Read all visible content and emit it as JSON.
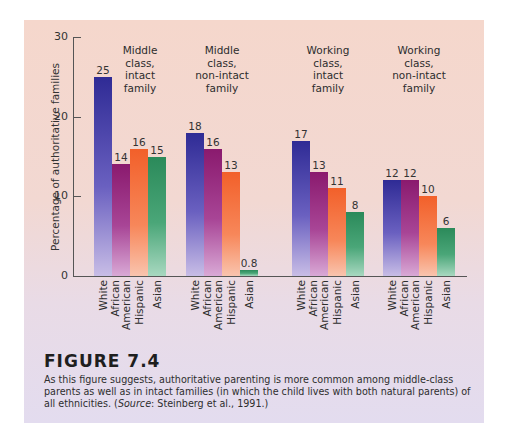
{
  "figure": {
    "title": "FIGURE 7.4",
    "caption_part1": "As this figure suggests, authoritative parenting is more common among middle-class parents as well as in intact families (in which the child lives with both natural parents) of all ethnicities. (",
    "caption_source_label": "Source",
    "caption_part2": ": Steinberg et al., 1991.)"
  },
  "colors": {
    "White": "#2f2b95",
    "African American": "#8a1a6e",
    "Hispanic": "#f2602a",
    "Asian": "#2b8a5a",
    "panel_top": "#f5d7cc",
    "panel_bottom": "#e3dcef"
  },
  "chart_data": {
    "type": "bar",
    "title": "",
    "xlabel": "",
    "ylabel": "Percentage of authoritative families",
    "ylim": [
      0,
      30
    ],
    "yticks": [
      0,
      10,
      20,
      30
    ],
    "grid": false,
    "legend": "none (category labels under each bar)",
    "groups": [
      "Middle class, intact family",
      "Middle class, non-intact family",
      "Working class, intact family",
      "Working class, non-intact family"
    ],
    "categories": [
      "White",
      "African American",
      "Hispanic",
      "Asian"
    ],
    "series": [
      {
        "name": "White",
        "values": [
          25,
          18,
          17,
          12
        ]
      },
      {
        "name": "African American",
        "values": [
          14,
          16,
          13,
          12
        ]
      },
      {
        "name": "Hispanic",
        "values": [
          16,
          13,
          11,
          10
        ]
      },
      {
        "name": "Asian",
        "values": [
          15,
          0.8,
          8,
          6
        ]
      }
    ],
    "group_data": [
      {
        "title_lines": [
          "Middle",
          "class,",
          "intact",
          "family"
        ],
        "values": [
          25,
          14,
          16,
          15
        ],
        "labels": [
          "25",
          "14",
          "16",
          "15"
        ]
      },
      {
        "title_lines": [
          "Middle",
          "class,",
          "non-intact",
          "family"
        ],
        "values": [
          18,
          16,
          13,
          0.8
        ],
        "labels": [
          "18",
          "16",
          "13",
          "0.8"
        ]
      },
      {
        "title_lines": [
          "Working",
          "class,",
          "intact",
          "family"
        ],
        "values": [
          17,
          13,
          11,
          8
        ],
        "labels": [
          "17",
          "13",
          "11",
          "8"
        ]
      },
      {
        "title_lines": [
          "Working",
          "class,",
          "non-intact",
          "family"
        ],
        "values": [
          12,
          12,
          10,
          6
        ],
        "labels": [
          "12",
          "12",
          "10",
          "6"
        ]
      }
    ],
    "category_label_lines": [
      [
        "White"
      ],
      [
        "African",
        "American"
      ],
      [
        "Hispanic"
      ],
      [
        "Asian"
      ]
    ]
  }
}
